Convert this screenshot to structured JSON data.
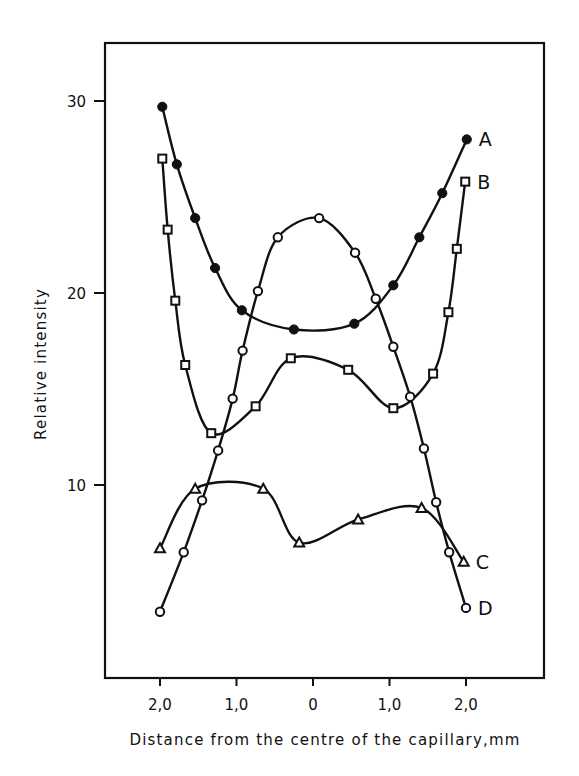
{
  "chart_data": {
    "type": "line",
    "title": "",
    "xlabel": "Distance from the centre of the capillary,mm",
    "ylabel": "Relative intensity",
    "xlim": [
      -2.6,
      2.6
    ],
    "ylim": [
      0,
      33
    ],
    "grid": false,
    "legend_position": "inline-right-end",
    "x_ticks": [
      {
        "value": -2.0,
        "label": "2,0"
      },
      {
        "value": -1.0,
        "label": "1,0"
      },
      {
        "value": 0.0,
        "label": "0"
      },
      {
        "value": 1.0,
        "label": "1,0"
      },
      {
        "value": 2.0,
        "label": "2,0"
      }
    ],
    "y_ticks": [
      {
        "value": 10,
        "label": "10"
      },
      {
        "value": 20,
        "label": "20"
      },
      {
        "value": 30,
        "label": "30"
      }
    ],
    "series": [
      {
        "name": "A",
        "marker": "filled-circle",
        "points": [
          [
            -1.97,
            29.7
          ],
          [
            -1.78,
            26.7
          ],
          [
            -1.54,
            23.9
          ],
          [
            -1.28,
            21.3
          ],
          [
            -0.93,
            19.1
          ],
          [
            -0.25,
            18.1
          ],
          [
            0.54,
            18.4
          ],
          [
            1.05,
            20.4
          ],
          [
            1.39,
            22.9
          ],
          [
            1.69,
            25.2
          ],
          [
            2.01,
            28.0
          ]
        ]
      },
      {
        "name": "B",
        "marker": "open-square",
        "points": [
          [
            -1.97,
            27.0
          ],
          [
            -1.9,
            23.3
          ],
          [
            -1.8,
            19.6
          ],
          [
            -1.67,
            16.25
          ],
          [
            -1.33,
            12.7
          ],
          [
            -0.75,
            14.1
          ],
          [
            -0.29,
            16.6
          ],
          [
            0.46,
            16.0
          ],
          [
            1.05,
            14.0
          ],
          [
            1.57,
            15.8
          ],
          [
            1.77,
            19.0
          ],
          [
            1.88,
            22.3
          ],
          [
            1.99,
            25.8
          ]
        ]
      },
      {
        "name": "C",
        "marker": "open-triangle",
        "points": [
          [
            -2.0,
            6.7
          ],
          [
            -1.54,
            9.8
          ],
          [
            -0.65,
            9.8
          ],
          [
            -0.18,
            7.0
          ],
          [
            0.59,
            8.2
          ],
          [
            1.42,
            8.8
          ],
          [
            1.97,
            6.0
          ]
        ]
      },
      {
        "name": "D",
        "marker": "open-circle",
        "points": [
          [
            -2.0,
            3.4
          ],
          [
            -1.69,
            6.5
          ],
          [
            -1.45,
            9.2
          ],
          [
            -1.24,
            11.8
          ],
          [
            -1.05,
            14.5
          ],
          [
            -0.92,
            17.0
          ],
          [
            -0.72,
            20.1
          ],
          [
            -0.46,
            22.9
          ],
          [
            0.08,
            23.9
          ],
          [
            0.55,
            22.1
          ],
          [
            0.82,
            19.7
          ],
          [
            1.05,
            17.2
          ],
          [
            1.27,
            14.6
          ],
          [
            1.45,
            11.9
          ],
          [
            1.61,
            9.1
          ],
          [
            1.78,
            6.5
          ],
          [
            2.0,
            3.6
          ]
        ]
      }
    ]
  }
}
